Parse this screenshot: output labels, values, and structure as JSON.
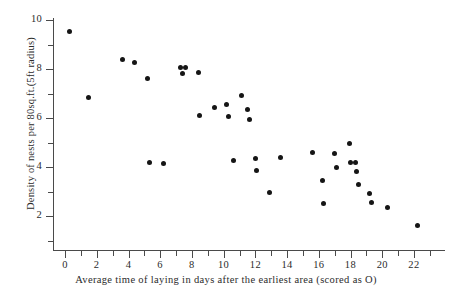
{
  "chart_data": {
    "type": "scatter",
    "title": "",
    "xlabel": "Average time of laying in days after the earliest area (scored as O)",
    "ylabel": "Density of nests per 80sq.ft.(5ft radius)",
    "xlim": [
      -0.8,
      23.2
    ],
    "ylim": [
      0,
      10.4
    ],
    "grid": false,
    "legend": null,
    "x_major_ticks": [
      0,
      2,
      4,
      6,
      8,
      10,
      12,
      14,
      16,
      18,
      20,
      22
    ],
    "x_minor_ticks": [
      1,
      3,
      5,
      7,
      9,
      11,
      13,
      15,
      17,
      19,
      21,
      23
    ],
    "x_ticklabels": [
      "0",
      "2",
      "4",
      "6",
      "8",
      "10",
      "12",
      "14",
      "16",
      "18",
      "20",
      "22"
    ],
    "y_major_ticks": [
      2,
      4,
      6,
      8,
      10
    ],
    "y_minor_ticks": [
      1,
      3,
      5,
      7,
      9
    ],
    "y_ticklabels": [
      "2",
      "4",
      "6",
      "8",
      "10"
    ],
    "marker": "filled-circle",
    "marker_color": "#151515",
    "axis_color": "#4a4a4a",
    "points": [
      {
        "x": 0.3,
        "y": 9.55
      },
      {
        "x": 1.5,
        "y": 6.85
      },
      {
        "x": 3.6,
        "y": 8.4
      },
      {
        "x": 4.4,
        "y": 8.25
      },
      {
        "x": 5.2,
        "y": 7.6
      },
      {
        "x": 5.3,
        "y": 4.2
      },
      {
        "x": 6.2,
        "y": 4.15
      },
      {
        "x": 7.3,
        "y": 8.05
      },
      {
        "x": 7.6,
        "y": 8.05
      },
      {
        "x": 7.4,
        "y": 7.8
      },
      {
        "x": 8.4,
        "y": 7.85
      },
      {
        "x": 8.5,
        "y": 6.1
      },
      {
        "x": 9.4,
        "y": 6.45
      },
      {
        "x": 10.2,
        "y": 6.55
      },
      {
        "x": 10.3,
        "y": 6.05
      },
      {
        "x": 11.1,
        "y": 6.9
      },
      {
        "x": 11.5,
        "y": 6.35
      },
      {
        "x": 11.6,
        "y": 5.95
      },
      {
        "x": 10.6,
        "y": 4.25
      },
      {
        "x": 12.0,
        "y": 4.35
      },
      {
        "x": 12.1,
        "y": 3.85
      },
      {
        "x": 12.9,
        "y": 2.95
      },
      {
        "x": 13.6,
        "y": 4.4
      },
      {
        "x": 15.6,
        "y": 4.6
      },
      {
        "x": 16.2,
        "y": 3.45
      },
      {
        "x": 16.3,
        "y": 2.5
      },
      {
        "x": 17.0,
        "y": 4.55
      },
      {
        "x": 17.1,
        "y": 4.0
      },
      {
        "x": 17.9,
        "y": 4.95
      },
      {
        "x": 18.0,
        "y": 4.2
      },
      {
        "x": 18.3,
        "y": 4.2
      },
      {
        "x": 18.4,
        "y": 3.8
      },
      {
        "x": 18.5,
        "y": 3.3
      },
      {
        "x": 19.2,
        "y": 2.9
      },
      {
        "x": 19.3,
        "y": 2.55
      },
      {
        "x": 20.3,
        "y": 2.35
      },
      {
        "x": 22.2,
        "y": 1.6
      }
    ]
  }
}
